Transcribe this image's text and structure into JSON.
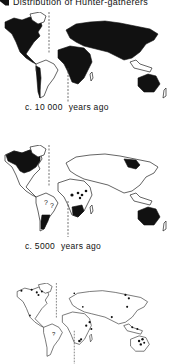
{
  "figure": {
    "title": "Distribution of Hunter-gatherers",
    "legend_icon": "black-fill-swatch",
    "colors": {
      "hunter_gatherer_area": "#111111",
      "other_land": "#ffffff",
      "outline": "#222222"
    }
  },
  "maps": [
    {
      "id": "map-10000",
      "caption": "c. 10 000",
      "caption_suffix": "years ago",
      "coverage": "nearly all land filled black"
    },
    {
      "id": "map-5000",
      "caption": "c. 5000",
      "caption_suffix": "years ago",
      "coverage": "northern North America, southern South America, southern Africa, central African dots, northeast Siberia, Australia",
      "unknown_marker": "?"
    },
    {
      "id": "map-present",
      "caption": "",
      "caption_suffix": "",
      "coverage": "scattered dots only",
      "unknown_marker": "?"
    }
  ]
}
